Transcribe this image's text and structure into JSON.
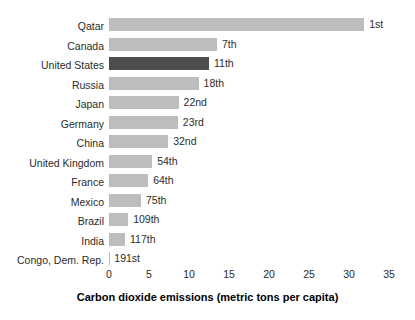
{
  "chart_data": {
    "type": "bar",
    "orientation": "horizontal",
    "title": "",
    "subtitle": "",
    "xlabel": "Carbon dioxide emissions (metric tons per capita)",
    "ylabel": "",
    "xlim": [
      0,
      35
    ],
    "xticks": [
      0,
      5,
      10,
      15,
      20,
      25,
      30,
      35
    ],
    "xtick_labels": [
      "0",
      "5",
      "10",
      "15",
      "20",
      "25",
      "30",
      "35"
    ],
    "grid": false,
    "legend": false,
    "categories": [
      "Qatar",
      "Canada",
      "United States",
      "Russia",
      "Japan",
      "Germany",
      "China",
      "United Kingdom",
      "France",
      "Mexico",
      "Brazil",
      "India",
      "Congo, Dem. Rep."
    ],
    "values": [
      31.9,
      13.5,
      12.5,
      11.2,
      8.7,
      8.6,
      7.4,
      5.4,
      4.9,
      4.0,
      2.4,
      2.0,
      0.04
    ],
    "annotations": [
      "1st",
      "7th",
      "11th",
      "18th",
      "22nd",
      "23rd",
      "32nd",
      "54th",
      "64th",
      "75th",
      "109th",
      "117th",
      "191st"
    ],
    "highlight_index": 2,
    "colors": {
      "bar": "#bdbdbd",
      "bar_highlight": "#4d4d4d",
      "text": "#2b2b2b",
      "background": "#ffffff"
    }
  }
}
